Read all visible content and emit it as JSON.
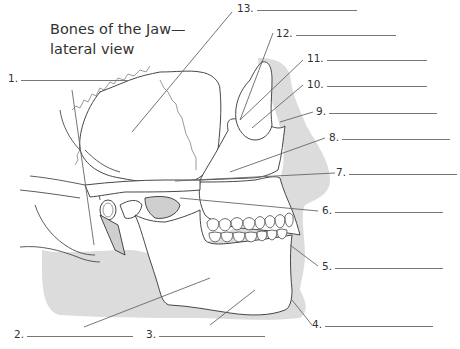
{
  "title": {
    "line1": "Bones of the Jaw—",
    "line2": "lateral view"
  },
  "colors": {
    "outline": "#333333",
    "shadow": "#d9d9d9",
    "leader": "#666666",
    "text": "#333333"
  },
  "labels": [
    {
      "number": "1.",
      "answer": ""
    },
    {
      "number": "2.",
      "answer": ""
    },
    {
      "number": "3.",
      "answer": ""
    },
    {
      "number": "4.",
      "answer": ""
    },
    {
      "number": "5.",
      "answer": ""
    },
    {
      "number": "6.",
      "answer": ""
    },
    {
      "number": "7.",
      "answer": ""
    },
    {
      "number": "8.",
      "answer": ""
    },
    {
      "number": "9.",
      "answer": ""
    },
    {
      "number": "10.",
      "answer": ""
    },
    {
      "number": "11.",
      "answer": ""
    },
    {
      "number": "12.",
      "answer": ""
    },
    {
      "number": "13.",
      "answer": ""
    }
  ]
}
